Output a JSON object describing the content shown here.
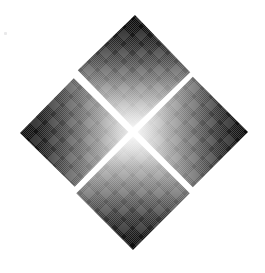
{
  "image": {
    "kind": "logo-emblem",
    "title": "Four-Diamond Emblem",
    "width": 265,
    "height": 273,
    "background_color": "#ffffff",
    "texture": "halftone-dither",
    "overall_shape": "large diamond composed of four smaller diamonds around a white X-shaped gap"
  },
  "palette": {
    "background": "#ffffff",
    "darkest": "#0a0a0a",
    "dark": "#1c1c1c",
    "mid_dark": "#4a4a4a",
    "mid": "#7d7d7d",
    "light": "#c8c8c8",
    "lightest": "#f4f4f4",
    "speck": "#e9e9ea",
    "gap": "#ffffff"
  },
  "geometry": {
    "center": {
      "x": 133,
      "y": 132
    },
    "outer_apexes": {
      "top": {
        "x": 135,
        "y": 15
      },
      "right": {
        "x": 248,
        "y": 132
      },
      "bottom": {
        "x": 133,
        "y": 250
      },
      "left": {
        "x": 20,
        "y": 133
      }
    },
    "gap_width_px": 9,
    "rotation_deg": 45
  },
  "diamonds": [
    {
      "id": "top",
      "label": "Top Diamond",
      "gradient_direction": "dark at top apex to light at bottom (center)",
      "from_color": "#0a0a0a",
      "to_color": "#f2f2f2",
      "apex": {
        "x": 135,
        "y": 15
      }
    },
    {
      "id": "right",
      "label": "Right Diamond",
      "gradient_direction": "light at left (center) to dark at right apex",
      "from_color": "#f2f2f2",
      "to_color": "#0f0f0f",
      "apex": {
        "x": 248,
        "y": 132
      }
    },
    {
      "id": "bottom",
      "label": "Bottom Diamond",
      "gradient_direction": "light at top (center) to dark at bottom apex",
      "from_color": "#f4f4f4",
      "to_color": "#0a0a0a",
      "apex": {
        "x": 133,
        "y": 250
      }
    },
    {
      "id": "left",
      "label": "Left Diamond",
      "gradient_direction": "dark at left apex to light at right (center)",
      "from_color": "#0d0d0d",
      "to_color": "#ededed",
      "apex": {
        "x": 20,
        "y": 133
      }
    }
  ],
  "artifacts": [
    {
      "id": "speck",
      "label": "Scan Speck",
      "x": 4,
      "y": 32,
      "color": "#e9e9ea"
    }
  ]
}
